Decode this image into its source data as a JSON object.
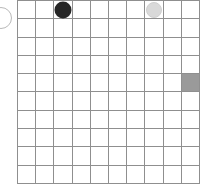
{
  "board": {
    "name": "grid-board",
    "columns": 10,
    "rows": 10,
    "grid_line_color": "#8f8f8f",
    "background_color": "#ffffff",
    "filled_cell_color": "#9a9a9a",
    "column_labels": [
      "1",
      "2",
      "3",
      "4",
      "5",
      "6",
      "7",
      "8",
      "9",
      "10"
    ],
    "row_labels": [
      "1",
      "2",
      "3",
      "4",
      "5",
      "6",
      "7",
      "8",
      "9",
      "10"
    ],
    "cells": [
      [
        {
          "state": "empty"
        },
        {
          "state": "empty"
        },
        {
          "state": "dark-piece"
        },
        {
          "state": "empty"
        },
        {
          "state": "empty"
        },
        {
          "state": "empty"
        },
        {
          "state": "empty"
        },
        {
          "state": "light-piece"
        },
        {
          "state": "empty"
        },
        {
          "state": "empty"
        }
      ],
      [
        {
          "state": "empty"
        },
        {
          "state": "empty"
        },
        {
          "state": "empty"
        },
        {
          "state": "empty"
        },
        {
          "state": "empty"
        },
        {
          "state": "empty"
        },
        {
          "state": "empty"
        },
        {
          "state": "empty"
        },
        {
          "state": "empty"
        },
        {
          "state": "empty"
        }
      ],
      [
        {
          "state": "empty"
        },
        {
          "state": "empty"
        },
        {
          "state": "empty"
        },
        {
          "state": "empty"
        },
        {
          "state": "empty"
        },
        {
          "state": "empty"
        },
        {
          "state": "empty"
        },
        {
          "state": "empty"
        },
        {
          "state": "empty"
        },
        {
          "state": "empty"
        }
      ],
      [
        {
          "state": "empty"
        },
        {
          "state": "empty"
        },
        {
          "state": "empty"
        },
        {
          "state": "empty"
        },
        {
          "state": "empty"
        },
        {
          "state": "empty"
        },
        {
          "state": "empty"
        },
        {
          "state": "empty"
        },
        {
          "state": "empty"
        },
        {
          "state": "empty"
        }
      ],
      [
        {
          "state": "empty"
        },
        {
          "state": "empty"
        },
        {
          "state": "empty"
        },
        {
          "state": "empty"
        },
        {
          "state": "empty"
        },
        {
          "state": "empty"
        },
        {
          "state": "empty"
        },
        {
          "state": "empty"
        },
        {
          "state": "empty"
        },
        {
          "state": "filled"
        }
      ],
      [
        {
          "state": "empty"
        },
        {
          "state": "empty"
        },
        {
          "state": "empty"
        },
        {
          "state": "empty"
        },
        {
          "state": "empty"
        },
        {
          "state": "empty"
        },
        {
          "state": "empty"
        },
        {
          "state": "empty"
        },
        {
          "state": "empty"
        },
        {
          "state": "empty"
        }
      ],
      [
        {
          "state": "empty"
        },
        {
          "state": "empty"
        },
        {
          "state": "empty"
        },
        {
          "state": "empty"
        },
        {
          "state": "empty"
        },
        {
          "state": "empty"
        },
        {
          "state": "empty"
        },
        {
          "state": "empty"
        },
        {
          "state": "empty"
        },
        {
          "state": "empty"
        }
      ],
      [
        {
          "state": "empty"
        },
        {
          "state": "empty"
        },
        {
          "state": "empty"
        },
        {
          "state": "empty"
        },
        {
          "state": "empty"
        },
        {
          "state": "empty"
        },
        {
          "state": "empty"
        },
        {
          "state": "empty"
        },
        {
          "state": "empty"
        },
        {
          "state": "empty"
        }
      ],
      [
        {
          "state": "empty"
        },
        {
          "state": "empty"
        },
        {
          "state": "empty"
        },
        {
          "state": "empty"
        },
        {
          "state": "empty"
        },
        {
          "state": "empty"
        },
        {
          "state": "empty"
        },
        {
          "state": "empty"
        },
        {
          "state": "empty"
        },
        {
          "state": "empty"
        }
      ],
      [
        {
          "state": "empty"
        },
        {
          "state": "empty"
        },
        {
          "state": "empty"
        },
        {
          "state": "empty"
        },
        {
          "state": "empty"
        },
        {
          "state": "empty"
        },
        {
          "state": "empty"
        },
        {
          "state": "empty"
        },
        {
          "state": "empty"
        },
        {
          "state": "empty"
        }
      ]
    ]
  },
  "pieces": {
    "dark": {
      "name": "dark-piece",
      "color": "#262626",
      "position": {
        "row": 1,
        "column": 3
      }
    },
    "light": {
      "name": "light-piece",
      "color": "#d9d9d9",
      "position": {
        "row": 1,
        "column": 8
      }
    }
  },
  "edge_marker": {
    "name": "edge-circle-outline",
    "color": "#b9b9b9",
    "clipped": "left"
  }
}
